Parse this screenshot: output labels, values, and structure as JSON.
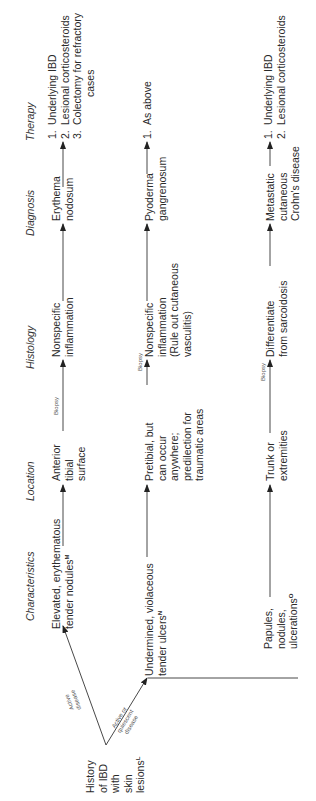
{
  "diagram": {
    "orientation": "rotated-90-ccw",
    "headers": {
      "characteristics": "Characteristics",
      "location": "Location",
      "histology": "Histology",
      "diagnosis": "Diagnosis",
      "therapy": "Therapy"
    },
    "origin": {
      "lines": [
        "History",
        "of IBD",
        "with",
        "skin",
        "lesions"
      ],
      "superscript": "L"
    },
    "branch_labels": {
      "active": [
        "Active",
        "disease"
      ],
      "active_or_quiescent": [
        "Active or",
        "quiescent",
        "disease"
      ]
    },
    "biopsy_label": "Biopsy",
    "rows": [
      {
        "characteristics": {
          "lines": [
            "Elevated, erythematous",
            "tender nodules"
          ],
          "superscript": "M"
        },
        "location": [
          "Anterior",
          "tibial",
          "surface"
        ],
        "histology": [
          "Nonspecific",
          "inflammation"
        ],
        "diagnosis": [
          "Erythema",
          "nodosum"
        ],
        "therapy": [
          {
            "num": "1.",
            "text": "Underlying IBD"
          },
          {
            "num": "2.",
            "text": "Lesional corticosteroids"
          },
          {
            "num": "3.",
            "text": "Colectomy for refractory",
            "cont": "cases"
          }
        ]
      },
      {
        "characteristics": {
          "lines": [
            "Undermined, violaceous",
            "tender ulcers"
          ],
          "superscript": "N"
        },
        "location": [
          "Pretibial, but",
          "can occur",
          "anywhere;",
          "predilection for",
          "traumatic areas"
        ],
        "histology": [
          "Nonspecific",
          "inflammation",
          "(Rule out cutaneous",
          "vasculitis)"
        ],
        "diagnosis": [
          "Pyoderma",
          "gangrenosum"
        ],
        "therapy": [
          {
            "num": "1.",
            "text": "As above"
          }
        ]
      },
      {
        "characteristics": {
          "lines": [
            "Papules,",
            "nodules,",
            "ulcerations"
          ],
          "superscript": "O"
        },
        "location": [
          "Trunk or",
          "extremities"
        ],
        "histology": [
          "Differentiate",
          "from sarcoidosis"
        ],
        "diagnosis": [
          "Metastatic",
          "cutaneous",
          "Crohn's disease"
        ],
        "therapy": [
          {
            "num": "1.",
            "text": "Underlying IBD"
          },
          {
            "num": "2.",
            "text": "Lesional corticosteroids"
          }
        ]
      }
    ]
  }
}
